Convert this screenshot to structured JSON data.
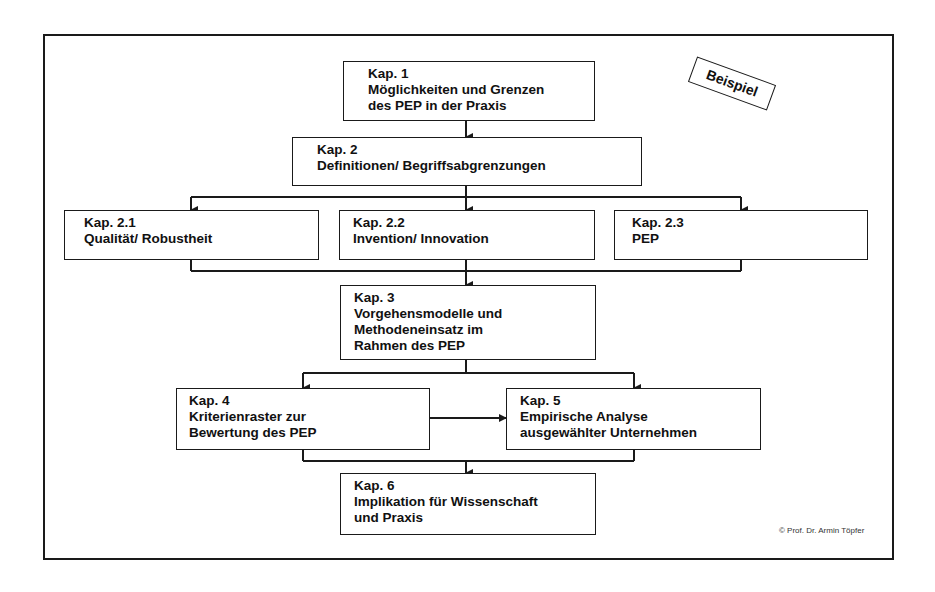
{
  "diagram": {
    "stamp": "Beispiel",
    "copyright": "© Prof. Dr. Armin Töpfer",
    "boxes": {
      "kap1": {
        "lines": [
          "Kap. 1",
          "Möglichkeiten und Grenzen",
          "des PEP in der Praxis"
        ]
      },
      "kap2": {
        "lines": [
          "Kap. 2",
          "Definitionen/ Begriffsabgrenzungen"
        ]
      },
      "kap2_1": {
        "lines": [
          "Kap. 2.1",
          "Qualität/ Robustheit"
        ]
      },
      "kap2_2": {
        "lines": [
          "Kap. 2.2",
          "Invention/ Innovation"
        ]
      },
      "kap2_3": {
        "lines": [
          "Kap. 2.3",
          "PEP"
        ]
      },
      "kap3": {
        "lines": [
          "Kap. 3",
          "Vorgehensmodelle und",
          "Methodeneinsatz im",
          "Rahmen des PEP"
        ]
      },
      "kap4": {
        "lines": [
          "Kap. 4",
          "Kriterienraster zur",
          "Bewertung des PEP"
        ]
      },
      "kap5": {
        "lines": [
          "Kap. 5",
          "Empirische Analyse",
          "ausgewählter Unternehmen"
        ]
      },
      "kap6": {
        "lines": [
          "Kap. 6",
          "Implikation für Wissenschaft",
          "und Praxis"
        ]
      }
    },
    "edges": [
      [
        "kap1",
        "kap2"
      ],
      [
        "kap2",
        "kap2_1"
      ],
      [
        "kap2",
        "kap2_2"
      ],
      [
        "kap2",
        "kap2_3"
      ],
      [
        "kap2_1",
        "kap3"
      ],
      [
        "kap2_2",
        "kap3"
      ],
      [
        "kap2_3",
        "kap3"
      ],
      [
        "kap3",
        "kap4"
      ],
      [
        "kap3",
        "kap5"
      ],
      [
        "kap4",
        "kap5"
      ],
      [
        "kap4",
        "kap6"
      ],
      [
        "kap5",
        "kap6"
      ]
    ],
    "colors": {
      "line": "#1a1a1a",
      "background": "#ffffff"
    }
  }
}
